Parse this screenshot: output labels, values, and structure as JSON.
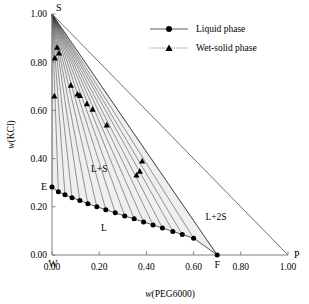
{
  "chart_data": {
    "type": "scatter",
    "title": "",
    "xlabel": "w(PEG6000)",
    "ylabel": "w(KCl)",
    "xlim": [
      0.0,
      1.0
    ],
    "ylim": [
      0.0,
      1.0
    ],
    "grid": false,
    "xticks": [
      "0.00",
      "0.20",
      "0.40",
      "0.60",
      "0.80",
      "1.00"
    ],
    "xtick_values": [
      0.0,
      0.2,
      0.4,
      0.6,
      0.8,
      1.0
    ],
    "yticks": [
      "0.00",
      "0.20",
      "0.40",
      "0.60",
      "0.80",
      "1.00"
    ],
    "ytick_values": [
      0.0,
      0.2,
      0.4,
      0.6,
      0.8,
      1.0
    ],
    "legend_position": "top-right",
    "legend": [
      {
        "label": "Liquid phase",
        "marker": "circle",
        "line": "solid"
      },
      {
        "label": "Wet-solid  phase",
        "marker": "triangle",
        "line": "dotted"
      }
    ],
    "vertices": [
      {
        "name": "S",
        "x": 0.0,
        "y": 1.0,
        "anchor": "above-right"
      },
      {
        "name": "W",
        "x": 0.0,
        "y": 0.0,
        "anchor": "below-left"
      },
      {
        "name": "P",
        "x": 1.0,
        "y": 0.0,
        "anchor": "right"
      },
      {
        "name": "E",
        "x": 0.0,
        "y": 0.28,
        "anchor": "left"
      },
      {
        "name": "F",
        "x": 0.7,
        "y": 0.0,
        "anchor": "below"
      }
    ],
    "region_labels": [
      {
        "text": "L",
        "x": 0.22,
        "y": 0.1
      },
      {
        "text": "L+S",
        "x": 0.2,
        "y": 0.345
      },
      {
        "text": "L+2S",
        "x": 0.695,
        "y": 0.145
      }
    ],
    "series": [
      {
        "name": "Liquid phase",
        "marker": "circle",
        "line": "solid",
        "points": [
          {
            "x": 0.0,
            "y": 0.282
          },
          {
            "x": 0.027,
            "y": 0.262
          },
          {
            "x": 0.055,
            "y": 0.25
          },
          {
            "x": 0.085,
            "y": 0.238
          },
          {
            "x": 0.118,
            "y": 0.226
          },
          {
            "x": 0.152,
            "y": 0.213
          },
          {
            "x": 0.19,
            "y": 0.2
          },
          {
            "x": 0.228,
            "y": 0.188
          },
          {
            "x": 0.268,
            "y": 0.175
          },
          {
            "x": 0.308,
            "y": 0.162
          },
          {
            "x": 0.348,
            "y": 0.15
          },
          {
            "x": 0.388,
            "y": 0.137
          },
          {
            "x": 0.428,
            "y": 0.125
          },
          {
            "x": 0.468,
            "y": 0.112
          },
          {
            "x": 0.512,
            "y": 0.098
          },
          {
            "x": 0.552,
            "y": 0.085
          },
          {
            "x": 0.6,
            "y": 0.07
          },
          {
            "x": 0.7,
            "y": 0.0
          }
        ]
      },
      {
        "name": "Wet-solid  phase",
        "marker": "triangle",
        "line": "dotted",
        "points": [
          {
            "x": 0.022,
            "y": 0.862
          },
          {
            "x": 0.03,
            "y": 0.838
          },
          {
            "x": 0.012,
            "y": 0.818
          },
          {
            "x": 0.01,
            "y": 0.66
          },
          {
            "x": 0.08,
            "y": 0.705
          },
          {
            "x": 0.108,
            "y": 0.668
          },
          {
            "x": 0.118,
            "y": 0.662
          },
          {
            "x": 0.148,
            "y": 0.628
          },
          {
            "x": 0.172,
            "y": 0.605
          },
          {
            "x": 0.232,
            "y": 0.54
          },
          {
            "x": 0.382,
            "y": 0.39
          },
          {
            "x": 0.372,
            "y": 0.348
          },
          {
            "x": 0.358,
            "y": 0.332
          }
        ]
      }
    ],
    "tie_lines": {
      "apex": {
        "x": 0.0,
        "y": 1.0
      },
      "description": "tie-lines radiating from S to points on liquid curve",
      "targets": [
        {
          "x": 0.0,
          "y": 0.282
        },
        {
          "x": 0.027,
          "y": 0.262
        },
        {
          "x": 0.055,
          "y": 0.25
        },
        {
          "x": 0.085,
          "y": 0.238
        },
        {
          "x": 0.118,
          "y": 0.226
        },
        {
          "x": 0.152,
          "y": 0.213
        },
        {
          "x": 0.19,
          "y": 0.2
        },
        {
          "x": 0.228,
          "y": 0.188
        },
        {
          "x": 0.268,
          "y": 0.175
        },
        {
          "x": 0.308,
          "y": 0.162
        },
        {
          "x": 0.348,
          "y": 0.15
        },
        {
          "x": 0.388,
          "y": 0.137
        },
        {
          "x": 0.428,
          "y": 0.125
        },
        {
          "x": 0.468,
          "y": 0.112
        },
        {
          "x": 0.512,
          "y": 0.098
        },
        {
          "x": 0.552,
          "y": 0.085
        },
        {
          "x": 0.6,
          "y": 0.07
        },
        {
          "x": 0.7,
          "y": 0.0
        }
      ]
    },
    "boundary_lines": [
      {
        "from": {
          "x": 0.0,
          "y": 1.0
        },
        "to": {
          "x": 1.0,
          "y": 0.0
        },
        "style": "solid"
      },
      {
        "from": {
          "x": 0.0,
          "y": 1.0
        },
        "to": {
          "x": 0.7,
          "y": 0.0
        },
        "style": "solid"
      }
    ],
    "shaded_region": {
      "fill": "#efefef",
      "description": "L+S two-phase field between E-F liquid curve and S-F tie-line envelope"
    }
  },
  "colors": {
    "axis": "#808080",
    "line": "#333333",
    "marker": "#000000",
    "shade": "#efefef",
    "background": "#ffffff"
  }
}
